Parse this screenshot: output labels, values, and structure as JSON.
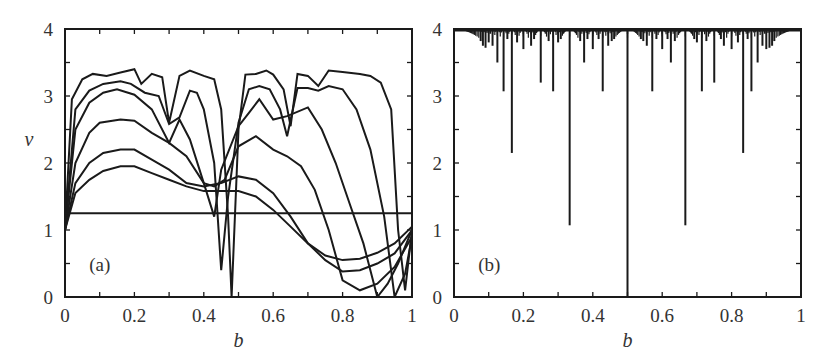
{
  "chart_data": [
    {
      "panel": "(a)",
      "type": "line",
      "title": "",
      "xlabel": "b",
      "ylabel": "v",
      "xlim": [
        0,
        1
      ],
      "ylim": [
        0,
        4
      ],
      "xticks": [
        "0",
        "0.2",
        "0.4",
        "0.6",
        "0.8",
        "1"
      ],
      "yticks": [
        "0",
        "1",
        "2",
        "3",
        "4"
      ],
      "grid": false,
      "legend": null,
      "series": [
        {
          "name": "curve-1",
          "x": [
            0,
            0.02,
            0.05,
            0.08,
            0.12,
            0.16,
            0.2,
            0.22,
            0.25,
            0.28,
            0.3,
            0.33,
            0.36,
            0.4,
            0.43,
            0.45,
            0.47,
            0.48,
            0.5,
            0.52,
            0.55,
            0.58,
            0.6,
            0.63,
            0.65,
            0.67,
            0.7,
            0.73,
            0.76,
            0.8,
            0.85,
            0.88,
            0.91,
            0.94,
            0.96,
            0.98,
            1.0
          ],
          "y": [
            1.0,
            2.95,
            3.25,
            3.33,
            3.3,
            3.35,
            3.4,
            3.18,
            3.33,
            3.28,
            2.6,
            3.3,
            3.38,
            3.3,
            3.25,
            2.8,
            1.2,
            0.0,
            2.5,
            3.32,
            3.33,
            3.38,
            3.32,
            3.1,
            2.55,
            3.33,
            3.3,
            3.15,
            3.38,
            3.36,
            3.33,
            3.3,
            3.2,
            2.8,
            1.0,
            0.1,
            1.0
          ]
        },
        {
          "name": "curve-2",
          "x": [
            0,
            0.03,
            0.07,
            0.11,
            0.16,
            0.19,
            0.23,
            0.27,
            0.3,
            0.33,
            0.36,
            0.38,
            0.4,
            0.43,
            0.45,
            0.47,
            0.5,
            0.53,
            0.56,
            0.59,
            0.62,
            0.64,
            0.67,
            0.7,
            0.73,
            0.76,
            0.8,
            0.84,
            0.88,
            0.92,
            0.95,
            0.98,
            1.0
          ],
          "y": [
            1.0,
            2.8,
            3.08,
            3.18,
            3.22,
            3.18,
            3.05,
            3.0,
            2.58,
            2.68,
            3.08,
            3.05,
            2.8,
            2.0,
            0.4,
            1.5,
            2.6,
            3.1,
            3.15,
            3.1,
            2.8,
            2.4,
            3.12,
            3.12,
            3.08,
            3.15,
            3.1,
            2.8,
            2.2,
            1.2,
            0.0,
            0.35,
            0.9
          ]
        },
        {
          "name": "curve-3",
          "x": [
            0,
            0.03,
            0.07,
            0.11,
            0.15,
            0.2,
            0.25,
            0.3,
            0.33,
            0.36,
            0.4,
            0.43,
            0.45,
            0.5,
            0.53,
            0.56,
            0.6,
            0.64,
            0.7,
            0.74,
            0.78,
            0.82,
            0.86,
            0.9,
            0.93,
            0.96,
            1.0
          ],
          "y": [
            1.0,
            2.5,
            2.9,
            3.05,
            3.1,
            3.02,
            2.8,
            2.3,
            2.65,
            2.35,
            1.7,
            1.2,
            1.9,
            2.55,
            2.75,
            2.95,
            2.65,
            2.7,
            2.83,
            2.5,
            2.0,
            1.4,
            0.8,
            0.0,
            0.2,
            0.5,
            1.0
          ]
        },
        {
          "name": "curve-4",
          "x": [
            0,
            0.03,
            0.07,
            0.1,
            0.16,
            0.2,
            0.25,
            0.3,
            0.35,
            0.4,
            0.43,
            0.46,
            0.5,
            0.55,
            0.6,
            0.64,
            0.68,
            0.72,
            0.76,
            0.8,
            0.85,
            0.9,
            0.95,
            1.0
          ],
          "y": [
            1.0,
            2.0,
            2.45,
            2.6,
            2.65,
            2.63,
            2.45,
            2.3,
            2.1,
            1.7,
            1.65,
            1.75,
            2.25,
            2.4,
            2.2,
            2.1,
            1.95,
            1.6,
            1.0,
            0.25,
            0.1,
            0.2,
            0.45,
            0.9
          ]
        },
        {
          "name": "curve-5",
          "x": [
            0,
            0.03,
            0.07,
            0.11,
            0.16,
            0.2,
            0.25,
            0.3,
            0.35,
            0.4,
            0.45,
            0.5,
            0.55,
            0.6,
            0.65,
            0.7,
            0.75,
            0.8,
            0.85,
            0.9,
            0.95,
            1.0
          ],
          "y": [
            1.0,
            1.7,
            2.0,
            2.15,
            2.2,
            2.2,
            2.05,
            1.9,
            1.7,
            1.65,
            1.7,
            1.8,
            1.75,
            1.55,
            1.2,
            0.8,
            0.55,
            0.38,
            0.4,
            0.5,
            0.65,
            1.0
          ]
        },
        {
          "name": "curve-6",
          "x": [
            0,
            0.03,
            0.07,
            0.11,
            0.16,
            0.2,
            0.25,
            0.3,
            0.35,
            0.4,
            0.45,
            0.5,
            0.55,
            0.6,
            0.65,
            0.7,
            0.75,
            0.8,
            0.85,
            0.9,
            0.95,
            1.0
          ],
          "y": [
            1.0,
            1.55,
            1.75,
            1.88,
            1.95,
            1.95,
            1.85,
            1.75,
            1.65,
            1.58,
            1.58,
            1.58,
            1.5,
            1.3,
            1.05,
            0.8,
            0.62,
            0.55,
            0.57,
            0.66,
            0.8,
            1.05
          ]
        },
        {
          "name": "horizontal-line",
          "x": [
            0,
            1
          ],
          "y": [
            1.25,
            1.25
          ]
        }
      ],
      "annotations": [
        "(a)"
      ]
    },
    {
      "panel": "(b)",
      "type": "line",
      "title": "",
      "xlabel": "b",
      "ylabel": "",
      "xlim": [
        0,
        1
      ],
      "ylim": [
        0,
        4
      ],
      "xticks": [
        "0",
        "0.2",
        "0.4",
        "0.6",
        "0.8",
        "1"
      ],
      "yticks": [
        "0",
        "1",
        "2",
        "3",
        "4"
      ],
      "grid": false,
      "legend": null,
      "description": "Devil's-staircase-like spectrum: value 4 almost everywhere with downward spikes at rational b",
      "spikes": [
        {
          "b": 0.5,
          "v": 0.0
        },
        {
          "b": 0.3333,
          "v": 1.07
        },
        {
          "b": 0.6667,
          "v": 1.07
        },
        {
          "b": 0.1667,
          "v": 2.15
        },
        {
          "b": 0.8333,
          "v": 2.15
        },
        {
          "b": 0.1429,
          "v": 3.07
        },
        {
          "b": 0.2857,
          "v": 3.07
        },
        {
          "b": 0.4286,
          "v": 3.07
        },
        {
          "b": 0.5714,
          "v": 3.07
        },
        {
          "b": 0.7143,
          "v": 3.07
        },
        {
          "b": 0.8571,
          "v": 3.07
        },
        {
          "b": 0.25,
          "v": 3.2
        },
        {
          "b": 0.75,
          "v": 3.2
        },
        {
          "b": 0.125,
          "v": 3.5
        },
        {
          "b": 0.375,
          "v": 3.5
        },
        {
          "b": 0.625,
          "v": 3.5
        },
        {
          "b": 0.875,
          "v": 3.5
        },
        {
          "b": 0.2,
          "v": 3.7
        },
        {
          "b": 0.4,
          "v": 3.7
        },
        {
          "b": 0.6,
          "v": 3.7
        },
        {
          "b": 0.8,
          "v": 3.7
        },
        {
          "b": 0.1111,
          "v": 3.75
        },
        {
          "b": 0.2222,
          "v": 3.75
        },
        {
          "b": 0.4444,
          "v": 3.75
        },
        {
          "b": 0.5556,
          "v": 3.75
        },
        {
          "b": 0.7778,
          "v": 3.75
        },
        {
          "b": 0.8889,
          "v": 3.75
        },
        {
          "b": 0.1,
          "v": 3.8
        },
        {
          "b": 0.3,
          "v": 3.8
        },
        {
          "b": 0.7,
          "v": 3.8
        },
        {
          "b": 0.9,
          "v": 3.7
        },
        {
          "b": 0.0909,
          "v": 3.72
        },
        {
          "b": 0.1818,
          "v": 3.8
        },
        {
          "b": 0.2727,
          "v": 3.82
        },
        {
          "b": 0.3636,
          "v": 3.82
        },
        {
          "b": 0.4545,
          "v": 3.82
        },
        {
          "b": 0.5455,
          "v": 3.82
        },
        {
          "b": 0.6364,
          "v": 3.82
        },
        {
          "b": 0.7273,
          "v": 3.82
        },
        {
          "b": 0.8182,
          "v": 3.8
        },
        {
          "b": 0.9091,
          "v": 3.72
        },
        {
          "b": 0.0833,
          "v": 3.75
        },
        {
          "b": 0.4167,
          "v": 3.85
        },
        {
          "b": 0.5833,
          "v": 3.85
        },
        {
          "b": 0.9167,
          "v": 3.75
        },
        {
          "b": 0.0769,
          "v": 3.82
        },
        {
          "b": 0.1538,
          "v": 3.85
        },
        {
          "b": 0.2308,
          "v": 3.85
        },
        {
          "b": 0.3077,
          "v": 3.85
        },
        {
          "b": 0.3846,
          "v": 3.85
        },
        {
          "b": 0.4615,
          "v": 3.85
        },
        {
          "b": 0.5385,
          "v": 3.85
        },
        {
          "b": 0.6154,
          "v": 3.85
        },
        {
          "b": 0.6923,
          "v": 3.85
        },
        {
          "b": 0.7692,
          "v": 3.85
        },
        {
          "b": 0.8462,
          "v": 3.85
        },
        {
          "b": 0.9231,
          "v": 3.82
        }
      ],
      "baseline": 4.0,
      "annotations": [
        "(b)"
      ]
    }
  ],
  "labels": {
    "panel_a": "(a)",
    "panel_b": "(b)",
    "x_axis_a": "b",
    "x_axis_b": "b",
    "y_axis_a": "v"
  }
}
